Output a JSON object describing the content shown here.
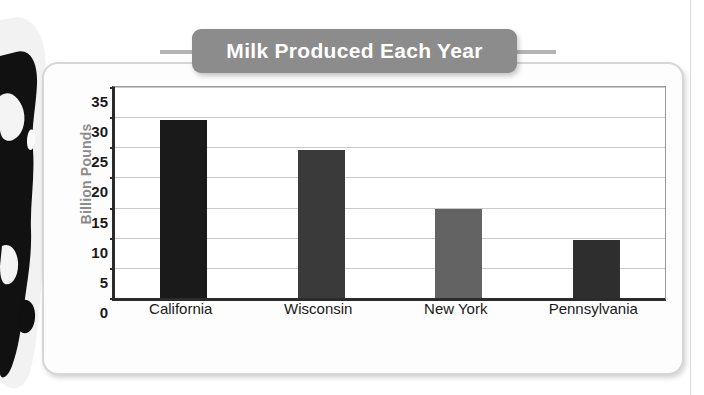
{
  "chart_data": {
    "type": "bar",
    "title": "Milk Produced Each Year",
    "xlabel": "States",
    "ylabel": "Billion Pounds",
    "categories": [
      "California",
      "Wisconsin",
      "New York",
      "Pennsylvania"
    ],
    "values": [
      29.5,
      24.5,
      14.7,
      9.6
    ],
    "bar_colors": [
      "#1a1a1a",
      "#3a3a3a",
      "#636363",
      "#2e2e2e"
    ],
    "ylim": [
      0,
      35
    ],
    "yticks": [
      0,
      5,
      10,
      15,
      20,
      25,
      30,
      35
    ],
    "ytick_labels": [
      "0",
      "5",
      "10",
      "15",
      "20",
      "25",
      "30",
      "35"
    ],
    "grid": true,
    "legend": "none"
  },
  "styles": {
    "title_banner_color": "#8c8c8c",
    "title_text_color": "#ffffff",
    "axis_title_color": "#8c8c8c",
    "tick_label_color": "#1a1a1a",
    "gridline_color": "#c9c9c9",
    "axis_line_color": "#2b2b2b",
    "card_background": "#fdfdfd",
    "card_border": "#d6d6d6",
    "plot_background": "#ffffff",
    "page_rule_color": "#dcdcdc"
  },
  "decoration": {
    "cow_photo_alt": "holstein-cow-photo"
  }
}
